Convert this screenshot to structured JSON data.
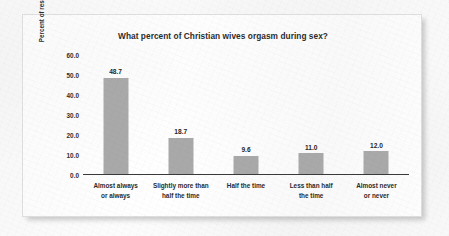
{
  "chart_data": {
    "type": "bar",
    "title": "What percent of Christian wives orgasm during sex?",
    "xlabel": "",
    "ylabel": "Percent of respondents",
    "categories": [
      "Almost always or always",
      "Slightly more than half the time",
      "Half the time",
      "Less than half the time",
      "Almost never or never"
    ],
    "category_lines": [
      [
        "Almost always",
        "or always"
      ],
      [
        "Slightly more than",
        "half the time"
      ],
      [
        "Half the time",
        ""
      ],
      [
        "Less than half",
        "the time"
      ],
      [
        "Almost never",
        "or never"
      ]
    ],
    "values": [
      48.7,
      18.7,
      9.6,
      11.0,
      12.0
    ],
    "value_labels": [
      "48.7",
      "18.7",
      "9.6",
      "11.0",
      "12.0"
    ],
    "ylim": [
      0.0,
      60.0
    ],
    "ytick_values": [
      60.0,
      50.0,
      40.0,
      30.0,
      20.0,
      10.0,
      0.0
    ],
    "ytick_labels": [
      "60.0",
      "50.0",
      "40.0",
      "30.0",
      "20.0",
      "10.0",
      "0.0"
    ],
    "grid": false,
    "legend": false,
    "bar_color": "#a9a9a9",
    "axis_color": "#3a3a3a",
    "text_color": "#2b2b2b",
    "card_background": "#fbfbfb"
  }
}
